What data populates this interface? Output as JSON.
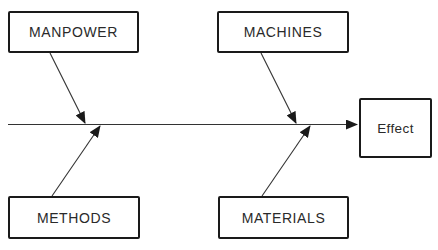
{
  "diagram": {
    "type": "cause-and-effect (fishbone)",
    "effect": {
      "label": "Effect"
    },
    "causes": [
      {
        "id": "manpower",
        "label": "MANPOWER",
        "position": "top-left"
      },
      {
        "id": "machines",
        "label": "MACHINES",
        "position": "top-right"
      },
      {
        "id": "methods",
        "label": "METHODS",
        "position": "bottom-left"
      },
      {
        "id": "materials",
        "label": "MATERIALS",
        "position": "bottom-right"
      }
    ],
    "colors": {
      "line": "#1a1a1a",
      "text": "#2a2a2a",
      "background": "#ffffff"
    }
  }
}
